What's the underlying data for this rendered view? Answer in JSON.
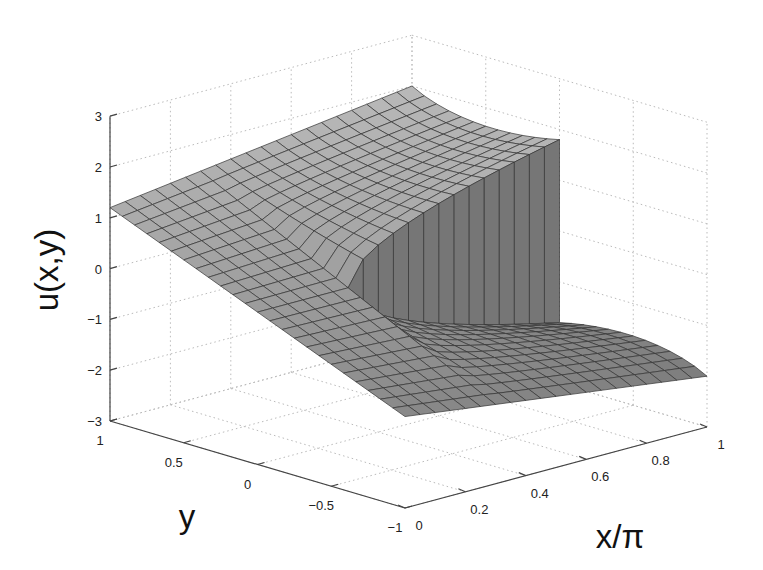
{
  "chart_data": {
    "type": "surface",
    "title": "",
    "xlabel": "x/π",
    "ylabel": "y",
    "zlabel": "u(x,y)",
    "xlim": [
      0,
      1
    ],
    "ylim": [
      -1,
      1
    ],
    "zlim": [
      -3,
      3
    ],
    "x_ticks": [
      "0",
      "0.2",
      "0.4",
      "0.6",
      "0.8",
      "1"
    ],
    "y_ticks": [
      "1",
      "0.5",
      "0",
      "−0.5",
      "−1"
    ],
    "z_ticks": [
      "3",
      "2",
      "1",
      "0",
      "−1",
      "−2",
      "−3"
    ],
    "grid": true,
    "colormap": "gray",
    "mesh": {
      "nx": 20,
      "ny": 24
    },
    "surface_samples": [
      {
        "x": 0,
        "y": 1,
        "u": 1.2
      },
      {
        "x": 0,
        "y": -1,
        "u": -1.2
      },
      {
        "x": 1,
        "y": 1,
        "u": 2.0
      },
      {
        "x": 1,
        "y": 0.0,
        "u_above": 1.8,
        "u_below": -1.8
      },
      {
        "x": 1,
        "y": -1,
        "u": -2.0
      }
    ],
    "discontinuity": {
      "along": "y = 0",
      "x_start": 0.3,
      "jump_at_x1": 3.6
    }
  }
}
